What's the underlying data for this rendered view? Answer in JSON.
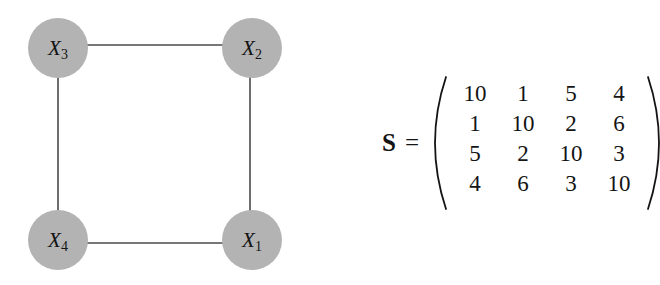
{
  "figure": {
    "background_color": "#ffffff",
    "graph": {
      "node_fill": "#b3b3b3",
      "edge_color": "#4a4a4a",
      "label_color": "#141414",
      "nodes": [
        {
          "id": "X3",
          "base": "X",
          "sub": "3",
          "cx": 58,
          "cy": 48,
          "r": 30
        },
        {
          "id": "X2",
          "base": "X",
          "sub": "2",
          "cx": 252,
          "cy": 48,
          "r": 30
        },
        {
          "id": "X4",
          "base": "X",
          "sub": "4",
          "cx": 58,
          "cy": 240,
          "r": 30
        },
        {
          "id": "X1",
          "base": "X",
          "sub": "1",
          "cx": 252,
          "cy": 240,
          "r": 30
        }
      ],
      "edges": [
        {
          "from": "X3",
          "to": "X2"
        },
        {
          "from": "X3",
          "to": "X4"
        },
        {
          "from": "X2",
          "to": "X1"
        },
        {
          "from": "X4",
          "to": "X1"
        }
      ]
    },
    "equation": {
      "matrix_name": "S",
      "equals": "=",
      "left_paren": "(",
      "right_paren": ")",
      "matrix_rows": [
        [
          "10",
          "1",
          "5",
          "4"
        ],
        [
          "1",
          "10",
          "2",
          "6"
        ],
        [
          "5",
          "2",
          "10",
          "3"
        ],
        [
          "4",
          "6",
          "3",
          "10"
        ]
      ]
    }
  }
}
